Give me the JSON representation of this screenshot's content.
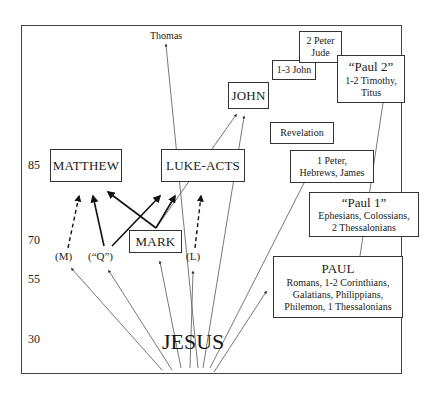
{
  "diagram": {
    "type": "New Testament writings dependency/timeline diagram",
    "years": [
      "85",
      "70",
      "55",
      "30"
    ],
    "sources": {
      "m": "(M)",
      "q": "(“Q”)",
      "l": "(L)"
    },
    "root": "JESUS",
    "top_label": "Thomas",
    "boxes": {
      "matthew": "MATTHEW",
      "luke_acts": "LUKE-ACTS",
      "mark": "MARK",
      "john": "JOHN",
      "john_letters": "1-3 John",
      "peter2_jude": {
        "line1": "2 Peter",
        "line2": "Jude"
      },
      "paul2": {
        "title": "“Paul 2”",
        "line1": "1-2 Timothy,",
        "line2": "Titus"
      },
      "revelation": "Revelation",
      "peter1": {
        "line1": "1 Peter,",
        "line2": "Hebrews, James"
      },
      "paul1": {
        "title": "“Paul 1”",
        "line1": "Ephesians, Colossians,",
        "line2": "2 Thessalonians"
      },
      "paul": {
        "title": "PAUL",
        "line1": "Romans, 1-2 Corinthians,",
        "line2": "Galatians, Philippians,",
        "line3": "Philemon, 1 Thessalonians"
      }
    },
    "edges": [
      {
        "from": "JESUS",
        "to": "(M)"
      },
      {
        "from": "JESUS",
        "to": "(“Q”)"
      },
      {
        "from": "JESUS",
        "to": "MARK"
      },
      {
        "from": "JESUS",
        "to": "(L)"
      },
      {
        "from": "JESUS",
        "to": "Thomas"
      },
      {
        "from": "JESUS",
        "to": "JOHN"
      },
      {
        "from": "JESUS",
        "to": "1 Peter, Hebrews, James"
      },
      {
        "from": "JESUS",
        "to": "PAUL"
      },
      {
        "from": "(M)",
        "to": "MATTHEW",
        "style": "dashed"
      },
      {
        "from": "(“Q”)",
        "to": "MATTHEW",
        "style": "bold"
      },
      {
        "from": "(“Q”)",
        "to": "LUKE-ACTS",
        "style": "bold"
      },
      {
        "from": "MARK",
        "to": "MATTHEW",
        "style": "bold"
      },
      {
        "from": "MARK",
        "to": "LUKE-ACTS",
        "style": "bold"
      },
      {
        "from": "MARK",
        "to": "JOHN"
      },
      {
        "from": "(L)",
        "to": "LUKE-ACTS",
        "style": "dashed"
      },
      {
        "from": "PAUL",
        "to": "“Paul 2”",
        "style": "line"
      }
    ]
  }
}
